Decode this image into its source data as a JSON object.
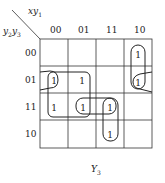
{
  "kmap": {
    "row_var_label": "y2y3",
    "col_var_label": "xy1",
    "col_headers": [
      "00",
      "01",
      "11",
      "10"
    ],
    "row_headers": [
      "00",
      "01",
      "11",
      "10"
    ],
    "cells": [
      [
        "",
        "",
        "",
        "1"
      ],
      [
        "1",
        "1",
        "",
        "1"
      ],
      [
        "1",
        "1",
        "1",
        ""
      ],
      [
        "",
        "",
        "1",
        ""
      ]
    ],
    "output_label": "Y3",
    "groupings": [
      {
        "name": "col-10-rows-00-01",
        "cells": [
          [
            0,
            3
          ],
          [
            1,
            3
          ]
        ]
      },
      {
        "name": "row-01-wrap",
        "cells": [
          [
            1,
            0
          ],
          [
            1,
            3
          ]
        ]
      },
      {
        "name": "quad-rows-01-11-cols-00-01",
        "cells": [
          [
            1,
            0
          ],
          [
            1,
            1
          ],
          [
            2,
            0
          ],
          [
            2,
            1
          ]
        ]
      },
      {
        "name": "row-11-cols-01-11",
        "cells": [
          [
            2,
            1
          ],
          [
            2,
            2
          ]
        ]
      },
      {
        "name": "col-11-rows-11-10",
        "cells": [
          [
            2,
            2
          ],
          [
            3,
            2
          ]
        ]
      }
    ]
  }
}
